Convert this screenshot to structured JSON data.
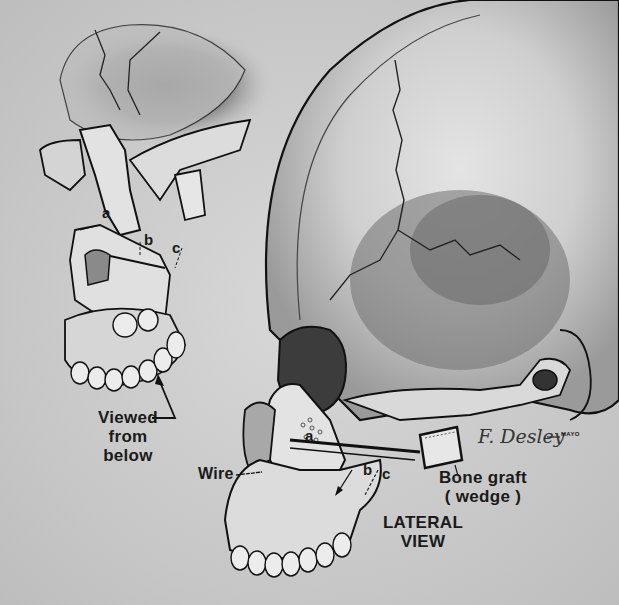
{
  "figure": {
    "type": "anatomical illustration",
    "background": "#c9c9c9",
    "line_color": "#1a1a1a"
  },
  "upper_left_view": {
    "caption": "Viewed from below",
    "caption_lines": [
      "Viewed from",
      "below"
    ],
    "markers": [
      "a",
      "b",
      "c"
    ]
  },
  "lateral_view": {
    "caption_lines": [
      "LATERAL",
      "VIEW"
    ],
    "markers": [
      "a",
      "b",
      "c"
    ],
    "labels": {
      "wire": "Wire",
      "bone_graft_line1": "Bone graft",
      "bone_graft_line2": "( wedge )"
    }
  },
  "signature": {
    "text": "F. Desley",
    "mark": "MAYO"
  }
}
